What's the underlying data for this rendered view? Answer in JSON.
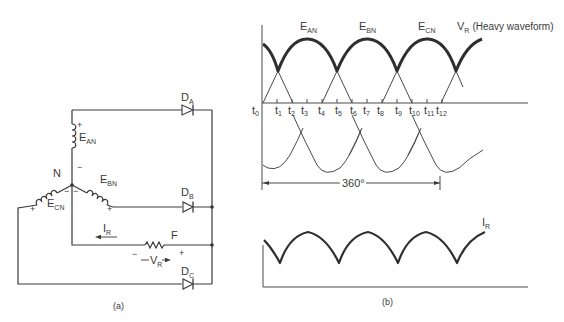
{
  "figure": {
    "part_a": {
      "caption": "(a)",
      "neutral_label": "N",
      "sources": [
        {
          "name": "E",
          "sub": "AN",
          "plus": "+",
          "minus": "−"
        },
        {
          "name": "E",
          "sub": "BN",
          "plus": "+",
          "minus": "−"
        },
        {
          "name": "E",
          "sub": "CN",
          "plus": "+",
          "minus": "−"
        }
      ],
      "diodes": [
        {
          "name": "D",
          "sub": "A"
        },
        {
          "name": "D",
          "sub": "B"
        },
        {
          "name": "D",
          "sub": "C"
        }
      ],
      "load": {
        "label": "F",
        "current_label": "I",
        "current_sub": "R",
        "voltage_label": "V",
        "voltage_sub": "R",
        "plus": "+",
        "minus": "−"
      }
    },
    "part_b": {
      "caption": "(b)",
      "curve_labels": [
        {
          "name": "E",
          "sub": "AN"
        },
        {
          "name": "E",
          "sub": "BN"
        },
        {
          "name": "E",
          "sub": "CN"
        }
      ],
      "vr_label": {
        "name": "V",
        "sub": "R",
        "note": "(Heavy waveform)"
      },
      "time_ticks": [
        "t0",
        "t1",
        "t2",
        "t3",
        "t4",
        "t5",
        "t6",
        "t7",
        "t8",
        "t9",
        "t10",
        "t11",
        "t12"
      ],
      "period_label": "360°",
      "current_label": {
        "name": "I",
        "sub": "R"
      }
    }
  }
}
